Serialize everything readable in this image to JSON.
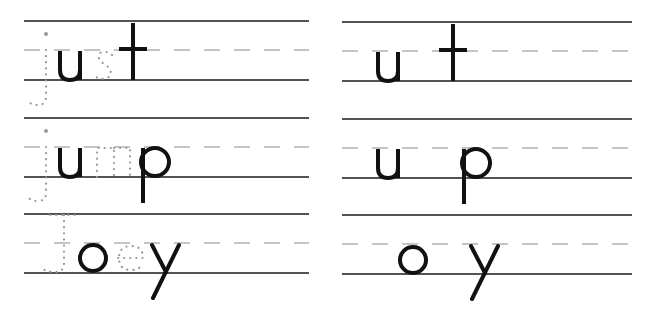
{
  "worksheet": {
    "type": "handwriting-practice",
    "colors": {
      "solid_line": "#1a1a1a",
      "dashed_line": "#8a8a8a",
      "ink": "#111111",
      "trace_dots": "#9a9a9a"
    },
    "left_panel": {
      "rows": [
        {
          "word": "just",
          "letters": [
            {
              "char": "j",
              "style": "traced"
            },
            {
              "char": "u",
              "style": "solid"
            },
            {
              "char": "s",
              "style": "traced"
            },
            {
              "char": "t",
              "style": "solid"
            }
          ]
        },
        {
          "word": "jump",
          "letters": [
            {
              "char": "j",
              "style": "traced"
            },
            {
              "char": "u",
              "style": "solid"
            },
            {
              "char": "m",
              "style": "traced"
            },
            {
              "char": "p",
              "style": "solid"
            }
          ]
        },
        {
          "word": "Joey",
          "letters": [
            {
              "char": "J",
              "style": "traced"
            },
            {
              "char": "o",
              "style": "solid"
            },
            {
              "char": "e",
              "style": "traced"
            },
            {
              "char": "y",
              "style": "solid"
            }
          ]
        }
      ]
    },
    "right_panel": {
      "rows": [
        {
          "letters": [
            {
              "char": "u",
              "style": "solid"
            },
            {
              "char": "t",
              "style": "solid"
            }
          ]
        },
        {
          "letters": [
            {
              "char": "u",
              "style": "solid"
            },
            {
              "char": "p",
              "style": "solid"
            }
          ]
        },
        {
          "letters": [
            {
              "char": "o",
              "style": "solid"
            },
            {
              "char": "y",
              "style": "solid"
            }
          ]
        }
      ]
    }
  }
}
